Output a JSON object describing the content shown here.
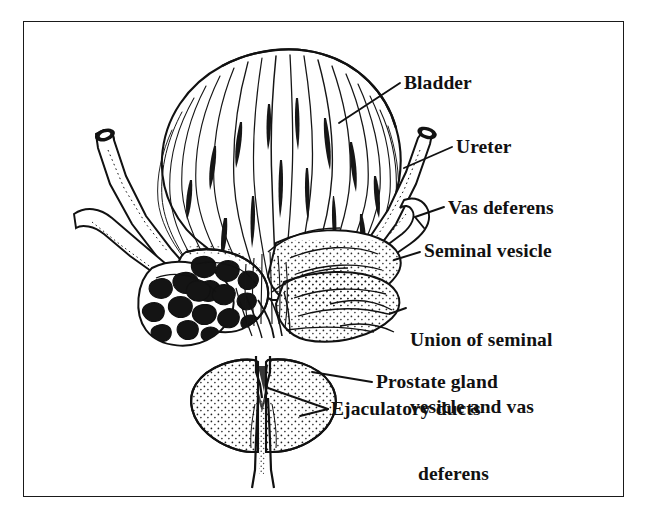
{
  "figure": {
    "domain": "anatomical-illustration",
    "title_visible": false,
    "style": "black-and-white pen-and-ink line drawing with stippling",
    "frame": {
      "visible": true,
      "color": "#1a1a1a",
      "border_width_px": 1.6
    },
    "background_color": "#ffffff",
    "ink_color": "#111111"
  },
  "labels": {
    "bladder": "Bladder",
    "ureter": "Ureter",
    "vas_deferens": "Vas deferens",
    "seminal_vesicle": "Seminal vesicle",
    "union_line1": "Union of seminal",
    "union_line2": "vesicle and vas",
    "union_line3": "deferens",
    "prostate_gland": "Prostate gland",
    "ejaculatory_ducts": "Ejaculatory ducts"
  },
  "structures": [
    {
      "name": "bladder",
      "label": "Bladder",
      "description": "Large dome-shaped organ at top rendered with flowing vertical detrusor muscle fiber strokes",
      "shading": "line-hatching"
    },
    {
      "name": "ureter-left",
      "label": "Ureter",
      "description": "Cut tube entering upper left with open dark lumen at the severed end",
      "shading": "stipple-edge"
    },
    {
      "name": "ureter-right",
      "label": "Ureter",
      "description": "Cut tube entering upper right with open dark lumen at the severed end",
      "shading": "stipple-edge"
    },
    {
      "name": "vas-deferens",
      "label": "Vas deferens",
      "description": "Slender duct crossing below each ureter toward the midline",
      "shading": "stipple-edge"
    },
    {
      "name": "seminal-vesicle-left",
      "label": "Seminal vesicle",
      "description": "Left vesicle shown in cross-section revealing dark irregular coiled tubule lumens",
      "shading": "cross-section-dark-lumens"
    },
    {
      "name": "seminal-vesicle-right",
      "label": "Seminal vesicle",
      "description": "Right vesicle shown intact as lobulated stippled sacs",
      "shading": "stipple"
    },
    {
      "name": "union-of-seminal-vesicle-and-vas-deferens",
      "label": "Union of seminal vesicle and vas deferens",
      "description": "Convergence point where vas deferens joins seminal vesicle duct",
      "shading": "line"
    },
    {
      "name": "prostate-gland",
      "label": "Prostate gland",
      "description": "Paired stippled lobes at the base flanking the urethra",
      "shading": "stipple"
    },
    {
      "name": "ejaculatory-ducts",
      "label": "Ejaculatory ducts",
      "description": "Short paired ducts passing through the prostate to the urethra",
      "shading": "line"
    },
    {
      "name": "urethra",
      "label": "",
      "description": "Narrow tube descending from the prostate apex at the bottom",
      "shading": "line"
    }
  ],
  "leader_lines": [
    {
      "for": "bladder",
      "from_x": 339,
      "from_y": 123,
      "to_x": 400,
      "to_y": 83
    },
    {
      "for": "ureter",
      "from_x": 404,
      "from_y": 168,
      "to_x": 452,
      "to_y": 147
    },
    {
      "for": "vas_deferens",
      "from_x": 418,
      "from_y": 216,
      "to_x": 444,
      "to_y": 207
    },
    {
      "for": "seminal_vesicle",
      "from_x": 396,
      "from_y": 259,
      "to_x": 420,
      "to_y": 252
    },
    {
      "for": "union",
      "from_x": 390,
      "from_y": 313,
      "to_x": 406,
      "to_y": 308
    },
    {
      "for": "prostate_gland",
      "from_x": 317,
      "from_y": 374,
      "to_x": 372,
      "to_y": 382
    },
    {
      "for": "ejaculatory_ducts",
      "from_x": 272,
      "from_y": 390,
      "to_x": 328,
      "to_y": 409
    }
  ]
}
